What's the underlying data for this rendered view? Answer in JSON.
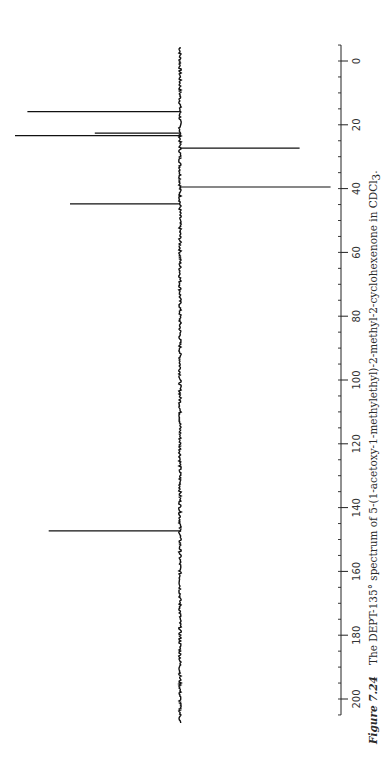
{
  "caption": {
    "label": "Figure 7.24",
    "text_before_sub": "The DEPT-135° spectrum of 5-(1-acetoxy-1-methylethyl)-2-methyl-2-cyclohexenone in CDCl",
    "subscript": "3",
    "text_after_sub": "."
  },
  "axis": {
    "unit": "ppm",
    "ticks": [
      0,
      20,
      40,
      60,
      80,
      100,
      120,
      140,
      160,
      180,
      200
    ],
    "tick_labels": [
      "0",
      "20",
      "40",
      "60",
      "80",
      "100",
      "120",
      "140",
      "160",
      "180",
      "200"
    ],
    "minor_step": 5,
    "range": [
      -5,
      205
    ]
  },
  "chart_data": {
    "type": "line",
    "xlabel": "δ (ppm)",
    "ylabel": "",
    "orientation": "rotated 90° counter-clockwise (ppm axis vertical, 0 at top, 200 at bottom)",
    "xlim": [
      -5,
      205
    ],
    "grid": false,
    "legend": "none",
    "peaks": [
      {
        "ppm": 15.9,
        "intensity": 0.86,
        "phase": "positive"
      },
      {
        "ppm": 22.6,
        "intensity": 0.48,
        "phase": "positive"
      },
      {
        "ppm": 23.4,
        "intensity": 0.93,
        "phase": "positive"
      },
      {
        "ppm": 27.3,
        "intensity": -0.58,
        "phase": "negative"
      },
      {
        "ppm": 39.5,
        "intensity": -0.73,
        "phase": "negative"
      },
      {
        "ppm": 44.8,
        "intensity": 0.62,
        "phase": "positive"
      },
      {
        "ppm": 147.3,
        "intensity": 0.74,
        "phase": "positive"
      }
    ]
  }
}
